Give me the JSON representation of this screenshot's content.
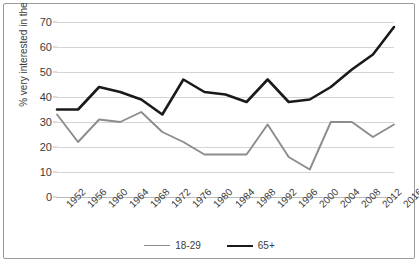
{
  "chart_data": {
    "type": "line",
    "title": "",
    "xlabel": "",
    "ylabel": "% very interested in the campaign",
    "ylim": [
      0,
      70
    ],
    "ytick_step": 10,
    "yticks": [
      0,
      10,
      20,
      30,
      40,
      50,
      60,
      70
    ],
    "grid": true,
    "legend_position": "bottom",
    "categories": [
      "1952",
      "1956",
      "1960",
      "1964",
      "1968",
      "1972",
      "1976",
      "1980",
      "1984",
      "1988",
      "1992",
      "1996",
      "2000",
      "2004",
      "2008",
      "2012",
      "2016"
    ],
    "series": [
      {
        "name": "18-29",
        "color": "#8c8c8c",
        "values": [
          33,
          22,
          31,
          30,
          34,
          26,
          22,
          17,
          17,
          17,
          29,
          16,
          11,
          30,
          30,
          24,
          29
        ]
      },
      {
        "name": "65+",
        "color": "#1a1a1a",
        "values": [
          35,
          35,
          44,
          42,
          39,
          33,
          47,
          42,
          41,
          38,
          47,
          38,
          39,
          44,
          51,
          57,
          68
        ]
      }
    ]
  },
  "axis": {
    "y_title": "% very interested in the campaign"
  },
  "legend": {
    "items": [
      {
        "label": "18-29",
        "color": "#8c8c8c"
      },
      {
        "label": "65+",
        "color": "#1a1a1a"
      }
    ]
  }
}
